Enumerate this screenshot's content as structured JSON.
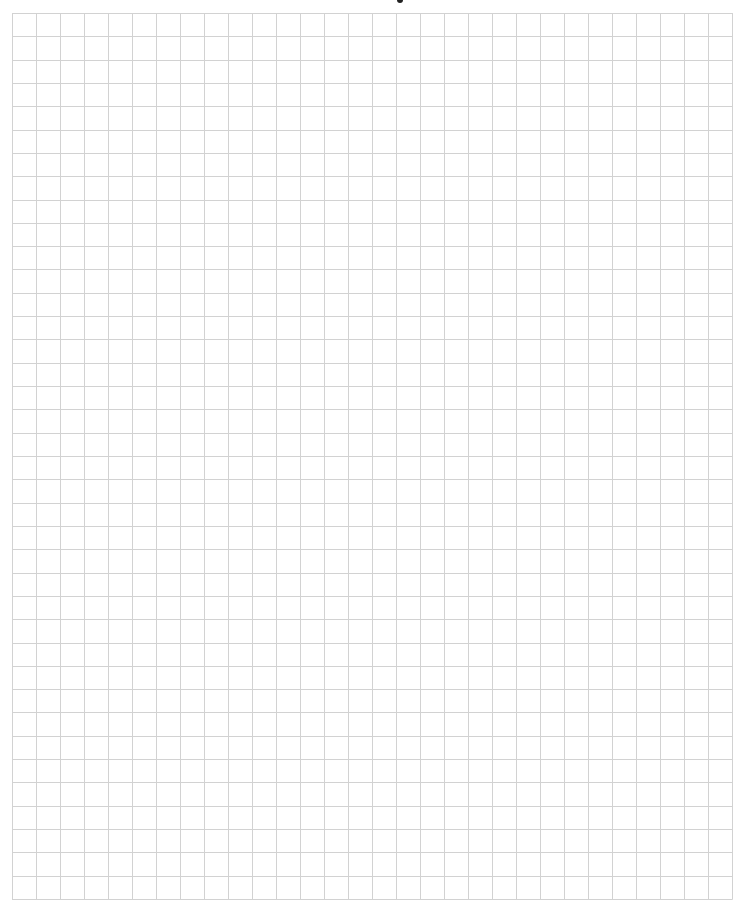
{
  "page": {
    "type": "graph-paper",
    "header_fragment": "cropped text descender at top"
  },
  "grid": {
    "columns": 30,
    "rows": 38,
    "line_color": "#d2d2d2",
    "background": "#ffffff",
    "left": 12,
    "top": 13,
    "width": 720,
    "height": 886
  }
}
